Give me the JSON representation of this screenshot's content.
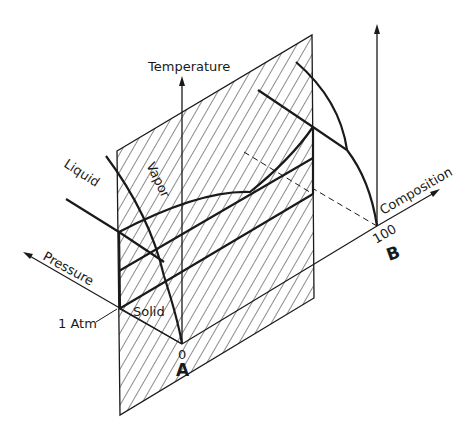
{
  "diagram": {
    "labels": {
      "temperature": "Temperature",
      "composition": "Composition",
      "pressure": "Pressure",
      "liquid": "Liquid",
      "vapor": "Vapor",
      "solid": "Solid",
      "one_atm": "1 Atm",
      "zero": "0",
      "hundred": "100",
      "component_a": "A",
      "component_b": "B"
    },
    "colors": {
      "ink": "#1a1a1a",
      "background": "#ffffff"
    }
  }
}
